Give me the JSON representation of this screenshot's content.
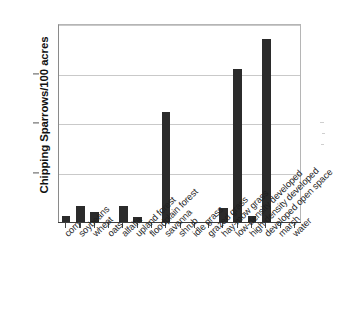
{
  "chart_data": {
    "type": "bar",
    "title": "",
    "xlabel": "",
    "ylabel": "Chipping Sparrows/100 acres",
    "ylim": [
      0,
      40
    ],
    "yticks": [
      0,
      10,
      20,
      30,
      40
    ],
    "ytick_labels": [
      "0",
      "10",
      "20",
      "30",
      "40"
    ],
    "grid": true,
    "legend": "none",
    "bar_color": "#2b2b2b",
    "categories": [
      "corn",
      "soybeans",
      "wheat",
      "oats",
      "alfalfa",
      "upland forest",
      "floodplain forest",
      "savanna",
      "shrub",
      "idle grass",
      "grazed grass",
      "hay-mow grass",
      "low-density developed",
      "high-density developed",
      "developed open space",
      "marsh",
      "water"
    ],
    "values": [
      1.3,
      3.2,
      2.0,
      0,
      3.3,
      1.1,
      0,
      22.2,
      0,
      0,
      0,
      2.8,
      31.0,
      1.2,
      37.0,
      0,
      0
    ]
  }
}
